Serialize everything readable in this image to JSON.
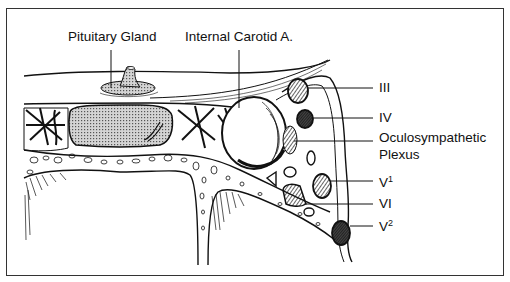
{
  "figure": {
    "type": "anatomical-cross-section",
    "labels": {
      "pituitary_gland": "Pituitary Gland",
      "internal_carotid": "Internal Carotid A.",
      "cn3": "III",
      "cn4": "IV",
      "oculosympathetic_line1": "Oculosympathetic",
      "oculosympathetic_line2": "Plexus",
      "v1_base": "V",
      "v1_sup": "1",
      "cn6": "VI",
      "v2_base": "V",
      "v2_sup": "2"
    },
    "colors": {
      "ink": "#111111",
      "border": "#333333",
      "stipple": "#9a9a9a",
      "background": "#ffffff"
    }
  }
}
